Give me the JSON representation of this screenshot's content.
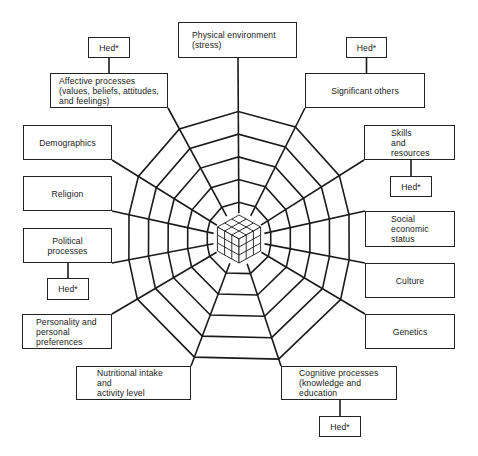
{
  "diagram": {
    "hed_label": "Hed*",
    "colors": {
      "line": "#1a1a1a",
      "background": "#ffffff"
    },
    "center": {
      "x": 239,
      "y": 239,
      "icon": "rubiks-cube-icon"
    },
    "rings": 5,
    "factors": [
      {
        "id": "physical-environment",
        "label": "Physical environment\n(stress)",
        "box": [
          178,
          22,
          119,
          36
        ],
        "align": "left",
        "pad": 13,
        "anchor": [
          238,
          58
        ],
        "hed": false
      },
      {
        "id": "affective-processes",
        "label": "Affective processes\n(values, beliefs, attitudes,\nand feelings)",
        "box": [
          50,
          73,
          118,
          35
        ],
        "align": "left",
        "pad": 8,
        "anchor": [
          168,
          108
        ],
        "hed": true,
        "hed_box": [
          88,
          37,
          42,
          21
        ]
      },
      {
        "id": "significant-others",
        "label": "Significant others",
        "box": [
          305,
          73,
          120,
          35
        ],
        "align": "center",
        "pad": 0,
        "anchor": [
          305,
          108
        ],
        "hed": true,
        "hed_box": [
          346,
          37,
          41,
          21
        ]
      },
      {
        "id": "demographics",
        "label": "Demographics",
        "box": [
          23,
          125,
          89,
          35
        ],
        "align": "center",
        "pad": 0,
        "anchor": [
          112,
          160
        ],
        "hed": false
      },
      {
        "id": "skills-and-resources",
        "label": "Skills\nand\nresources",
        "box": [
          364,
          125,
          91,
          35
        ],
        "align": "left",
        "pad": 26,
        "anchor": [
          364,
          160
        ],
        "hed": true,
        "hed_box": [
          390,
          176,
          42,
          21
        ]
      },
      {
        "id": "religion",
        "label": "Religion",
        "box": [
          23,
          176,
          89,
          35
        ],
        "align": "center",
        "pad": 0,
        "anchor": [
          112,
          211
        ],
        "hed": false
      },
      {
        "id": "social-economic-status",
        "label": "Social\neconomic\nstatus",
        "box": [
          365,
          211,
          90,
          36
        ],
        "align": "left",
        "pad": 25,
        "anchor": [
          365,
          211
        ],
        "hed": false
      },
      {
        "id": "political-processes",
        "label": "Political\nprocesses",
        "box": [
          23,
          228,
          89,
          35
        ],
        "align": "center",
        "pad": 0,
        "anchor": [
          112,
          263
        ],
        "hed": true,
        "hed_box": [
          47,
          278,
          42,
          22
        ]
      },
      {
        "id": "culture",
        "label": "Culture",
        "box": [
          365,
          263,
          90,
          35
        ],
        "align": "center",
        "pad": 0,
        "anchor": [
          365,
          263
        ],
        "hed": false
      },
      {
        "id": "personality",
        "label": "Personality and\npersonal\npreferences",
        "box": [
          22,
          314,
          90,
          35
        ],
        "align": "left",
        "pad": 13,
        "anchor": [
          112,
          314
        ],
        "hed": false
      },
      {
        "id": "genetics",
        "label": "Genetics",
        "box": [
          365,
          314,
          90,
          35
        ],
        "align": "center",
        "pad": 0,
        "anchor": [
          365,
          314
        ],
        "hed": false
      },
      {
        "id": "nutritional-intake",
        "label": "Nutritional intake\nand\nactivity level",
        "box": [
          76,
          366,
          115,
          34
        ],
        "align": "left",
        "pad": 20,
        "anchor": [
          191,
          366
        ],
        "hed": false
      },
      {
        "id": "cognitive-processes",
        "label": "Cognitive processes\n(knowledge and\neducation",
        "box": [
          281,
          366,
          116,
          34
        ],
        "align": "left",
        "pad": 17,
        "anchor": [
          281,
          366
        ],
        "hed": true,
        "hed_box": [
          319,
          416,
          42,
          21
        ]
      }
    ]
  }
}
